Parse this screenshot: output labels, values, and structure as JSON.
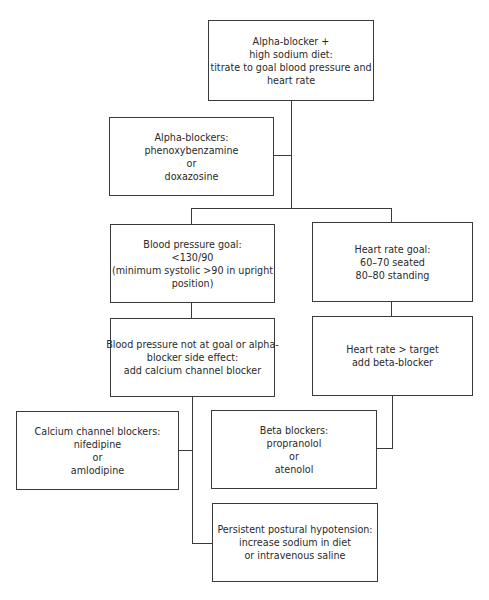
{
  "diagram": {
    "nodes": {
      "start": {
        "lines": [
          "Alpha-blocker +",
          "high sodium diet:",
          "titrate to goal blood pressure and",
          "heart rate"
        ]
      },
      "alpha_blockers": {
        "lines": [
          "Alpha-blockers:",
          "phenoxybenzamine",
          "or",
          "doxazosine"
        ]
      },
      "bp_goal": {
        "lines": [
          "Blood pressure goal:",
          "<130/90",
          "(minimum systolic >90 in upright",
          "position)"
        ]
      },
      "hr_goal": {
        "lines": [
          "Heart rate goal:",
          "60–70 seated",
          "80–80 standing"
        ]
      },
      "bp_not_at_goal": {
        "lines": [
          "Blood pressure not at goal or alpha-",
          "blocker side effect:",
          "add calcium channel blocker"
        ]
      },
      "hr_above_target": {
        "lines": [
          "Heart rate > target",
          "add beta-blocker"
        ]
      },
      "calcium_channel_blockers": {
        "lines": [
          "Calcium channel blockers:",
          "nifedipine",
          "or",
          "amlodipine"
        ]
      },
      "beta_blockers": {
        "lines": [
          "Beta blockers:",
          "propranolol",
          "or",
          "atenolol"
        ]
      },
      "postural_hypotension": {
        "lines": [
          "Persistent postural hypotension:",
          "increase sodium in diet",
          "or intravenous saline"
        ]
      }
    },
    "edges": [
      [
        "start",
        "alpha_blockers"
      ],
      [
        "start",
        "bp_goal"
      ],
      [
        "start",
        "hr_goal"
      ],
      [
        "bp_goal",
        "bp_not_at_goal"
      ],
      [
        "hr_goal",
        "hr_above_target"
      ],
      [
        "bp_not_at_goal",
        "calcium_channel_blockers"
      ],
      [
        "bp_not_at_goal",
        "postural_hypotension"
      ],
      [
        "hr_above_target",
        "beta_blockers"
      ]
    ]
  }
}
